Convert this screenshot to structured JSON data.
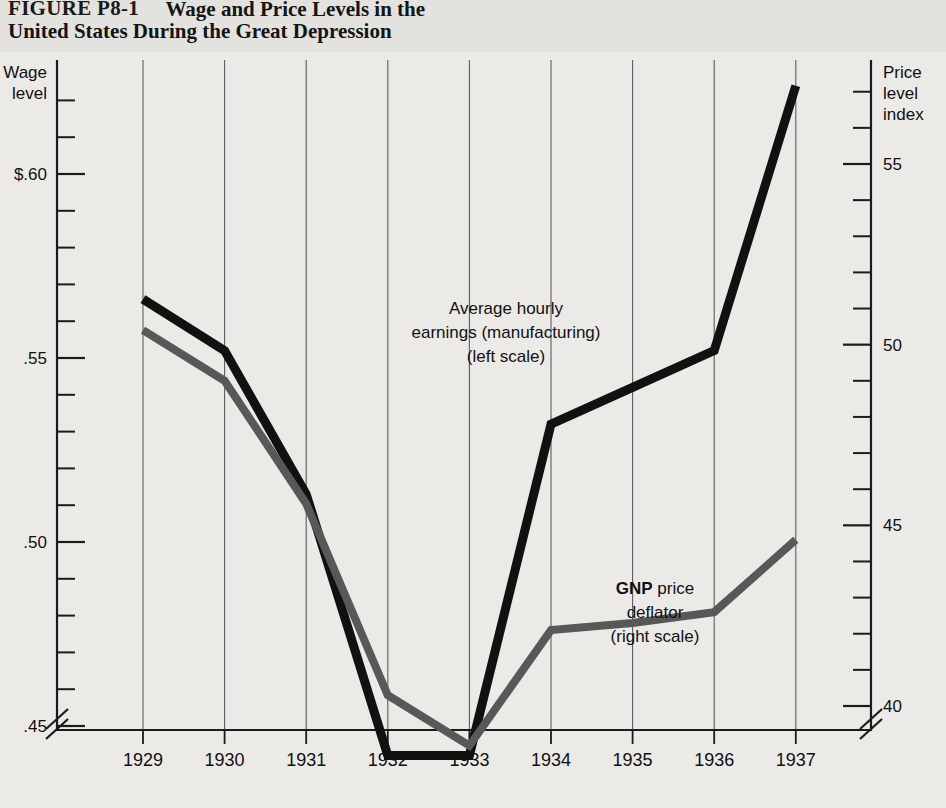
{
  "figure": {
    "label": "FIGURE P8-1",
    "title_line1": "Wage and Price Levels in the",
    "title_line2": "United States During the Great Depression"
  },
  "chart_data": {
    "type": "line",
    "title": "Wage and Price Levels in the United States During the Great Depression",
    "xlabel": "",
    "ylabel": "Wage level",
    "y2label": "Price level index",
    "categories": [
      "1929",
      "1930",
      "1931",
      "1932",
      "1933",
      "1934",
      "1935",
      "1936",
      "1937"
    ],
    "x": [
      1929,
      1930,
      1931,
      1932,
      1933,
      1934,
      1935,
      1936,
      1937
    ],
    "grid": "vertical",
    "legend": "inline-annotations",
    "left_axis": {
      "label": "Wage level",
      "ticks_major": [
        "$.60",
        ".55",
        ".50",
        ".45"
      ],
      "tick_values": [
        0.6,
        0.55,
        0.5,
        0.45
      ],
      "minor_step": 0.01,
      "range": [
        0.435,
        0.625
      ],
      "axis_break": true
    },
    "right_axis": {
      "label": "Price level index",
      "ticks_major": [
        "55",
        "50",
        "45",
        "40"
      ],
      "tick_values": [
        55,
        50,
        45,
        40
      ],
      "minor_step": 1,
      "range": [
        37.3,
        57.8
      ],
      "axis_break": true
    },
    "series": [
      {
        "name": "Average hourly earnings (manufacturing)",
        "scale": "left",
        "color": "#111111",
        "annotation": [
          "Average hourly",
          "earnings (manufacturing)",
          "(left scale)"
        ],
        "values": [
          0.566,
          0.552,
          0.513,
          0.442,
          0.442,
          0.532,
          0.542,
          0.552,
          0.624
        ]
      },
      {
        "name": "GNP price deflator",
        "scale": "right",
        "color": "#585858",
        "annotation": [
          "GNP price",
          "deflator",
          "(right scale)"
        ],
        "values": [
          50.4,
          49.0,
          45.6,
          40.3,
          38.9,
          42.1,
          42.3,
          42.6,
          44.6
        ]
      }
    ]
  }
}
